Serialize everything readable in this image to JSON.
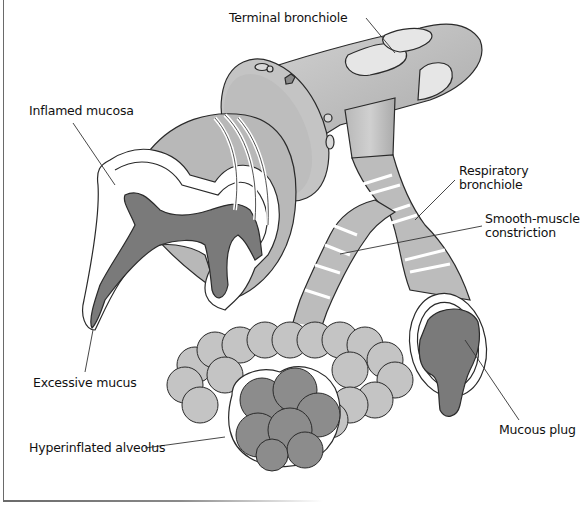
{
  "figure": {
    "caption_fragment": "…"
  },
  "labels": {
    "terminal_bronchiole": "Terminal bronchiole",
    "inflamed_mucosa": "Inflamed mucosa",
    "respiratory_bronchiole_line1": "Respiratory",
    "respiratory_bronchiole_line2": "bronchiole",
    "smooth_muscle_line1": "Smooth-muscle",
    "smooth_muscle_line2": "constriction",
    "excessive_mucus": "Excessive mucus",
    "hyperinflated_alveolus": "Hyperinflated alveolus",
    "mucous_plug": "Mucous plug"
  },
  "colors": {
    "tissue_light": "#c8c8c8",
    "tissue_mid": "#b4b4b4",
    "tissue_highlight": "#e6e6e6",
    "mucus_dark": "#7a7a7a",
    "alveolus_dark": "#8c8c8c",
    "outline": "#2a2a2a",
    "label_text": "#111111"
  }
}
